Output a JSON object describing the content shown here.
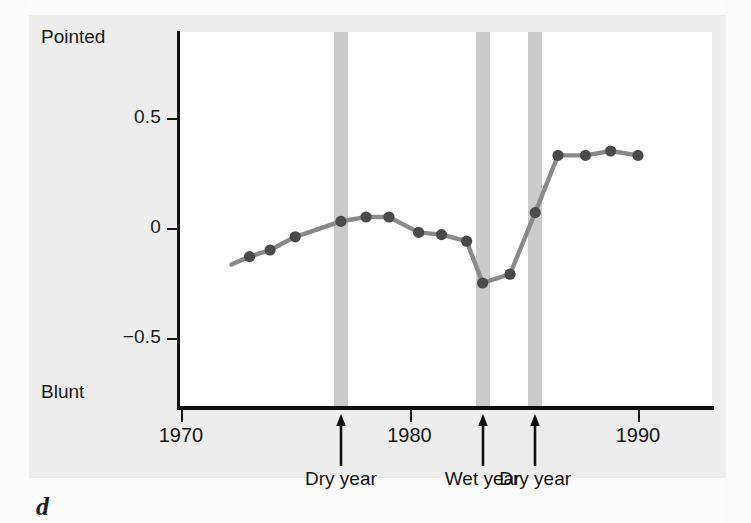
{
  "figure": {
    "part_letter": "d",
    "axis_pole_top": "Pointed",
    "axis_pole_bottom": "Blunt"
  },
  "colors": {
    "line": "#8a8a8a",
    "marker": "#4a4a4a",
    "event_band": "#c6c6c6",
    "axis": "#111111",
    "paper": "#ededed"
  },
  "chart_data": {
    "type": "line",
    "title": "",
    "subtitle": "",
    "xlabel": "",
    "ylabel": "Pointed / Blunt",
    "ylabel_top": "Pointed",
    "ylabel_bottom": "Blunt",
    "grid": false,
    "legend": "none",
    "xlim": [
      1970,
      1990.7
    ],
    "ylim": [
      -0.72,
      0.86
    ],
    "xticks": [
      1970,
      1980,
      1990
    ],
    "xtick_labels": [
      "1970",
      "1980",
      "1990"
    ],
    "yticks": [
      0.5,
      0,
      -0.5
    ],
    "ytick_labels": [
      "0.5",
      "0",
      "−0.5"
    ],
    "series": [
      {
        "name": "Beak shape index",
        "x": [
          1973.0,
          1973.9,
          1975.0,
          1977.0,
          1978.1,
          1979.1,
          1980.4,
          1981.4,
          1982.5,
          1983.2,
          1984.4,
          1985.5,
          1986.5,
          1987.7,
          1988.8,
          1990.0
        ],
        "y": [
          -0.13,
          -0.1,
          -0.04,
          0.03,
          0.05,
          0.05,
          -0.02,
          -0.03,
          -0.06,
          -0.25,
          -0.21,
          0.07,
          0.33,
          0.33,
          0.35,
          0.33
        ]
      }
    ],
    "annotations": [
      {
        "x": 1977.0,
        "label": "Dry year",
        "band": true
      },
      {
        "x": 1983.2,
        "label": "Wet year",
        "band": true
      },
      {
        "x": 1985.5,
        "label": "Dry year",
        "band": true
      }
    ]
  }
}
